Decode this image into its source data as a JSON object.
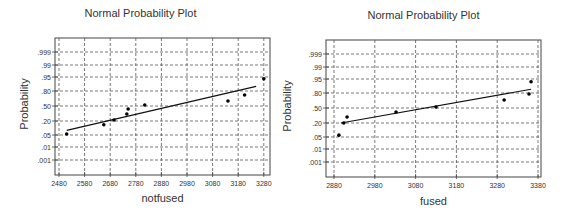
{
  "chart_data": [
    {
      "type": "scatter",
      "title": "Normal Probability Plot",
      "xlabel": "notfused",
      "ylabel": "Probability",
      "xlim": [
        2470,
        3290
      ],
      "x_ticks": [
        "2480",
        "2580",
        "2680",
        "2780",
        "2880",
        "2980",
        "3080",
        "3180",
        "3280"
      ],
      "y_ticks": [
        ".999",
        ".99",
        ".95",
        ".80",
        ".50",
        ".20",
        ".05",
        ".01",
        ".001"
      ],
      "grid": true,
      "points": [
        {
          "x": 2510,
          "p": 0.06
        },
        {
          "x": 2655,
          "p": 0.16
        },
        {
          "x": 2695,
          "p": 0.22
        },
        {
          "x": 2745,
          "p": 0.34
        },
        {
          "x": 2750,
          "p": 0.44
        },
        {
          "x": 2815,
          "p": 0.52
        },
        {
          "x": 3140,
          "p": 0.6
        },
        {
          "x": 3205,
          "p": 0.72
        },
        {
          "x": 3280,
          "p": 0.93
        }
      ],
      "fit_line": {
        "x0": 2510,
        "p0": 0.1,
        "x1": 3250,
        "p1": 0.85
      }
    },
    {
      "type": "scatter",
      "title": "Normal Probability Plot",
      "xlabel": "fused",
      "ylabel": "Probability",
      "xlim": [
        2870,
        3385
      ],
      "x_ticks": [
        "2880",
        "2980",
        "3080",
        "3180",
        "3280",
        "3380"
      ],
      "y_ticks": [
        ".999",
        ".99",
        ".95",
        ".80",
        ".50",
        ".20",
        ".05",
        ".01",
        ".001"
      ],
      "grid": true,
      "points": [
        {
          "x": 2892,
          "p": 0.07
        },
        {
          "x": 2904,
          "p": 0.2
        },
        {
          "x": 2912,
          "p": 0.32
        },
        {
          "x": 3032,
          "p": 0.42
        },
        {
          "x": 3130,
          "p": 0.52
        },
        {
          "x": 3297,
          "p": 0.66
        },
        {
          "x": 3358,
          "p": 0.78
        },
        {
          "x": 3363,
          "p": 0.92
        }
      ],
      "fit_line": {
        "x0": 2897,
        "p0": 0.2,
        "x1": 3363,
        "p1": 0.84
      }
    }
  ],
  "left": {
    "title": "Normal Probability Plot",
    "xlabel": "notfused",
    "ylabel": "Probability"
  },
  "right": {
    "title": "Normal Probability Plot",
    "xlabel": "fused",
    "ylabel": "Probability"
  }
}
